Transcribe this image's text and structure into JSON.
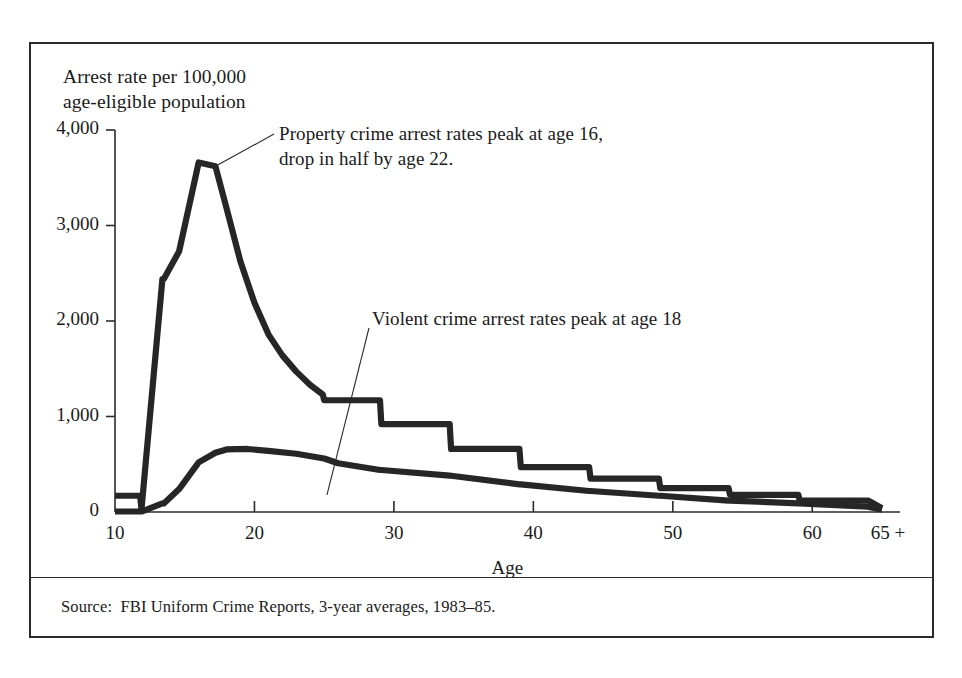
{
  "figure": {
    "y_axis_title": "Arrest rate per 100,000\nage-eligible population",
    "x_axis_title": "Age",
    "source": "Source:  FBI Uniform Crime Reports, 3-year averages, 1983–85.",
    "annotations": {
      "property": "Property crime arrest rates peak at age 16,\ndrop in half by age 22.",
      "violent": "Violent crime arrest rates peak at age 18"
    }
  },
  "style": {
    "ink": "#1a1a1a",
    "frame": "#2b2b2b",
    "curve": "#262626",
    "background": "#ffffff"
  },
  "chart_data": {
    "type": "line",
    "title": "",
    "subtitle": "",
    "xlabel": "Age",
    "ylabel": "Arrest rate per 100,000 age-eligible population",
    "xlim": [
      10,
      65
    ],
    "ylim": [
      0,
      4000
    ],
    "xticks": [
      10,
      20,
      30,
      40,
      50,
      60,
      65
    ],
    "xtick_labels": [
      "10",
      "20",
      "30",
      "40",
      "50",
      "60",
      "65 +"
    ],
    "yticks": [
      0,
      1000,
      2000,
      3000,
      4000
    ],
    "ytick_labels": [
      "0",
      "1,000",
      "2,000",
      "3,000",
      "4,000"
    ],
    "grid": false,
    "legend": "none",
    "annotations": [
      {
        "text": "Property crime arrest rates peak at age 16, drop in half by age 22.",
        "points_to_series": "Property crime",
        "target_x": 17.2,
        "target_y": 3620
      },
      {
        "text": "Violent crime arrest rates peak at age 18",
        "points_to_series": "Violent crime",
        "target_x": 25.2,
        "target_y": 430
      }
    ],
    "series": [
      {
        "name": "Property crime",
        "x": [
          10,
          11.8,
          11.9,
          13.4,
          13.5,
          14.6,
          16.0,
          17.2,
          18.0,
          19.0,
          20.0,
          21.0,
          22.0,
          23.0,
          24.0,
          24.9,
          25.0,
          29.0,
          29.1,
          34.0,
          34.1,
          39.0,
          39.1,
          44.0,
          44.1,
          49.0,
          49.1,
          54.0,
          54.1,
          59.0,
          59.1,
          64.0,
          65.0
        ],
        "y": [
          170,
          170,
          30,
          2440,
          2440,
          2730,
          3660,
          3620,
          3180,
          2620,
          2190,
          1860,
          1640,
          1470,
          1330,
          1230,
          1170,
          1170,
          920,
          920,
          660,
          660,
          470,
          470,
          350,
          350,
          250,
          250,
          180,
          180,
          120,
          120,
          40
        ]
      },
      {
        "name": "Violent crime",
        "x": [
          10,
          11.8,
          11.9,
          13.4,
          13.5,
          14.6,
          16.0,
          17.2,
          18.0,
          19.5,
          21.0,
          23.0,
          25.0,
          26.0,
          29.0,
          29.1,
          34.0,
          34.1,
          39.0,
          39.1,
          44.0,
          44.1,
          49.0,
          49.1,
          54.0,
          54.1,
          59.0,
          59.1,
          64.0,
          65.0
        ],
        "y": [
          5,
          5,
          5,
          90,
          90,
          240,
          520,
          620,
          655,
          660,
          640,
          610,
          560,
          510,
          440,
          440,
          380,
          380,
          290,
          290,
          220,
          220,
          170,
          170,
          120,
          120,
          90,
          90,
          55,
          25
        ]
      }
    ]
  }
}
